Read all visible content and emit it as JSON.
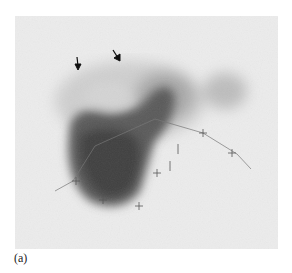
{
  "figure": {
    "panel_label": "(a)",
    "markers": {
      "arrows": 2,
      "crosses": 8
    }
  }
}
